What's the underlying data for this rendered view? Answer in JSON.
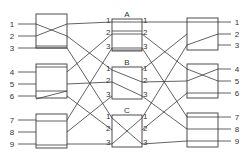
{
  "diagram": {
    "type": "three-stage switching network",
    "stroke_color": "#3a3a3a",
    "input_stage": {
      "switches": [
        {
          "id": "in1",
          "ports": [
            "1",
            "2",
            "3"
          ],
          "box": [
            36,
            14,
            31,
            34
          ]
        },
        {
          "id": "in2",
          "ports": [
            "4",
            "5",
            "6"
          ],
          "box": [
            36,
            64,
            31,
            34
          ]
        },
        {
          "id": "in3",
          "ports": [
            "7",
            "8",
            "9"
          ],
          "box": [
            36,
            114,
            31,
            34
          ]
        }
      ],
      "port_y": [
        [
          24,
          36,
          48
        ],
        [
          72,
          84,
          96
        ],
        [
          120,
          132,
          144
        ]
      ]
    },
    "middle_stage": {
      "switches": [
        {
          "id": "A",
          "label": "A",
          "ports_in": [
            "1",
            "2",
            "3"
          ],
          "ports_out": [
            "1",
            "2",
            "3"
          ],
          "box": [
            112,
            19,
            30,
            32
          ]
        },
        {
          "id": "B",
          "label": "B",
          "ports_in": [
            "1",
            "2",
            "3"
          ],
          "ports_out": [
            "1",
            "2",
            "3"
          ],
          "box": [
            112,
            67,
            30,
            32
          ]
        },
        {
          "id": "C",
          "label": "C",
          "ports_in": [
            "1",
            "2",
            "3"
          ],
          "ports_out": [
            "1",
            "2",
            "3"
          ],
          "box": [
            112,
            115,
            30,
            32
          ]
        }
      ],
      "port_y": [
        [
          22,
          34,
          48
        ],
        [
          70,
          82,
          96
        ],
        [
          118,
          130,
          144
        ]
      ]
    },
    "output_stage": {
      "switches": [
        {
          "id": "out1",
          "ports": [
            "1",
            "2",
            "3"
          ],
          "box": [
            187,
            18,
            31,
            32
          ]
        },
        {
          "id": "out2",
          "ports": [
            "4",
            "5",
            "6"
          ],
          "box": [
            187,
            64,
            31,
            34
          ]
        },
        {
          "id": "out3",
          "ports": [
            "7",
            "8",
            "9"
          ],
          "box": [
            187,
            113,
            31,
            34
          ]
        }
      ],
      "port_y": [
        [
          22,
          34,
          45
        ],
        [
          69,
          81,
          93
        ],
        [
          117,
          129,
          141
        ]
      ]
    }
  }
}
